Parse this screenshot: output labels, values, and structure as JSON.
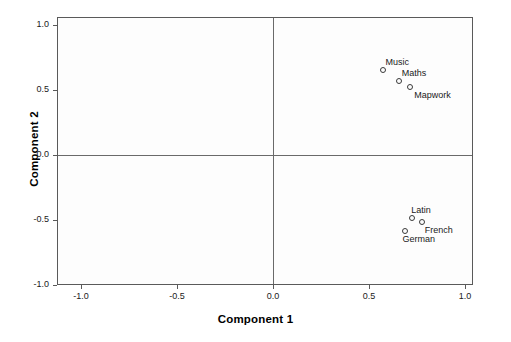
{
  "chart_data": {
    "type": "scatter",
    "title": "",
    "xlabel": "Component 1",
    "ylabel": "Component 2",
    "xlim": [
      -1.13,
      1.13
    ],
    "ylim": [
      -1.13,
      1.13
    ],
    "xticks": [
      "-1.0",
      "-0.5",
      "0.0",
      "0.5",
      "1.0"
    ],
    "xtick_values": [
      -1.0,
      -0.5,
      0.0,
      0.5,
      1.0
    ],
    "yticks": [
      "1.0",
      "0.5",
      "0.0",
      "-0.5",
      "-1.0"
    ],
    "ytick_values": [
      1.0,
      0.5,
      0.0,
      -0.5,
      -1.0
    ],
    "grid": false,
    "legend": "none",
    "zero_lines": true,
    "marker_style": "open-circle",
    "points": [
      {
        "label": "Music",
        "x": 0.57,
        "y": 0.66,
        "label_dx": 2,
        "label_dy": -13
      },
      {
        "label": "Maths",
        "x": 0.65,
        "y": 0.58,
        "label_dx": 3,
        "label_dy": -13
      },
      {
        "label": "Mapwork",
        "x": 0.71,
        "y": 0.53,
        "label_dx": 4,
        "label_dy": 3
      },
      {
        "label": "Latin",
        "x": 0.72,
        "y": -0.48,
        "label_dx": -1,
        "label_dy": -13
      },
      {
        "label": "French",
        "x": 0.77,
        "y": -0.51,
        "label_dx": 3,
        "label_dy": 3
      },
      {
        "label": "German",
        "x": 0.68,
        "y": -0.58,
        "label_dx": -2,
        "label_dy": 3
      }
    ]
  },
  "colors": {
    "frame": "#5a5a5a",
    "zero_line": "#6a6a6a",
    "marker_stroke": "#3a3a3a",
    "text": "#1a1a1a",
    "plot_background": "#fdfdfd",
    "figure_background": "#ffffff"
  }
}
